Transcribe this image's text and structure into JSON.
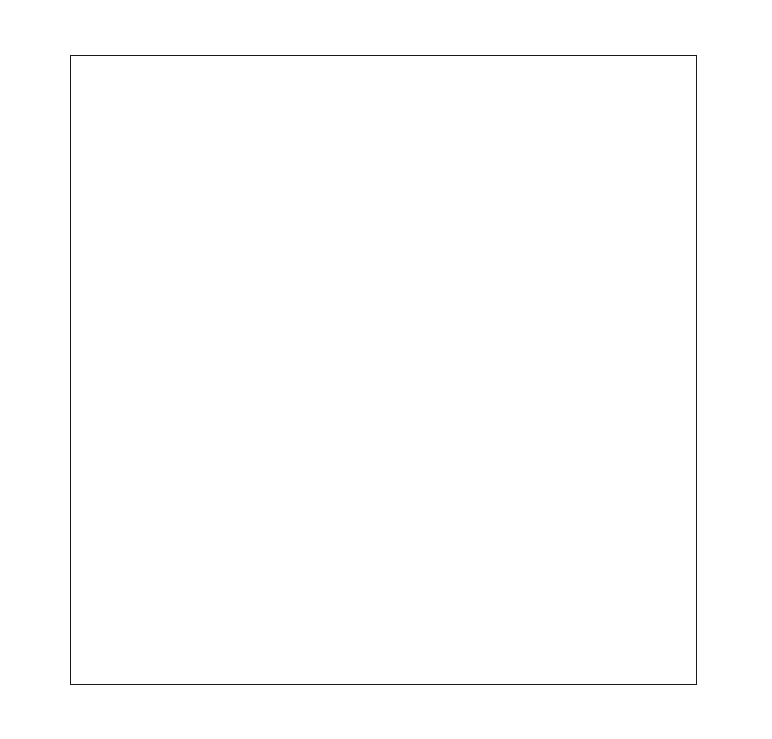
{
  "page": {
    "background_color": "#ffffff",
    "width": 772,
    "height": 739
  },
  "plot": {
    "frame_color": "#1a1a1a",
    "major_grid_color": "#2b2b2b",
    "minor_grid_color": "#b9b9b9",
    "left": 70,
    "top": 55,
    "width": 627,
    "height": 630
  },
  "chart_data": {
    "type": "grid",
    "title": "",
    "subtitle": "",
    "xlabel": "",
    "ylabel": "",
    "grid": "on",
    "legend": "none",
    "series": [],
    "values": [],
    "categories": [],
    "x_transform": "probit",
    "y_transform": "probit",
    "x_range_percent": [
      0.01,
      99.99
    ],
    "y_range_percent": [
      0.01,
      99.99
    ],
    "top_axis": {
      "position": "top",
      "direction": "descending-left-to-right",
      "labels": [
        "99.99",
        "99.96",
        "99.9",
        "99.8",
        "99",
        "98",
        "95",
        "90",
        "80",
        "70",
        "60",
        "50",
        "40",
        "30",
        "20",
        "10",
        "5",
        "2",
        "1",
        "0.2",
        "0.1",
        "0.04",
        "0.01"
      ],
      "values": [
        99.99,
        99.96,
        99.9,
        99.8,
        99,
        98,
        95,
        90,
        80,
        70,
        60,
        50,
        40,
        30,
        20,
        10,
        5,
        2,
        1,
        0.2,
        0.1,
        0.04,
        0.01
      ]
    },
    "bottom_axis": {
      "position": "bottom",
      "direction": "ascending-left-to-right",
      "labels": [
        "0.01",
        "0.04",
        "0.1",
        "0.2",
        "1",
        "2",
        "5",
        "10",
        "20",
        "30",
        "40",
        "50",
        "60",
        "70",
        "80",
        "90",
        "95",
        "98",
        "99",
        "99.8",
        "99.9",
        "99.96",
        "99.99"
      ],
      "values": [
        0.01,
        0.04,
        0.1,
        0.2,
        1,
        2,
        5,
        10,
        20,
        30,
        40,
        50,
        60,
        70,
        80,
        90,
        95,
        98,
        99,
        99.8,
        99.9,
        99.96,
        99.99
      ]
    },
    "left_axis": {
      "position": "left",
      "direction": "descending-top-to-bottom",
      "labels": [
        "99.99",
        "99.96",
        "99.9",
        "99.8",
        "99",
        "98",
        "95",
        "90",
        "80",
        "70",
        "60",
        "50",
        "40",
        "30",
        "20",
        "10",
        "5",
        "2",
        "1",
        "0.2",
        "0.1",
        "0.04",
        "0.01"
      ],
      "values": [
        99.99,
        99.96,
        99.9,
        99.8,
        99,
        98,
        95,
        90,
        80,
        70,
        60,
        50,
        40,
        30,
        20,
        10,
        5,
        2,
        1,
        0.2,
        0.1,
        0.04,
        0.01
      ]
    },
    "right_axis": {
      "position": "right",
      "direction": "ascending-top-to-bottom",
      "labels": [
        "0.01",
        "0.04",
        "0.1",
        "0.2",
        "1",
        "2",
        "5",
        "10",
        "20",
        "30",
        "40",
        "50",
        "60",
        "70",
        "80",
        "90",
        "95",
        "98",
        "99",
        "99.8",
        "99.9",
        "99.96",
        "99.99"
      ],
      "values": [
        0.01,
        0.04,
        0.1,
        0.2,
        1,
        2,
        5,
        10,
        20,
        30,
        40,
        50,
        60,
        70,
        80,
        90,
        95,
        98,
        99,
        99.8,
        99.9,
        99.96,
        99.99
      ]
    },
    "minor_gridline_percent_values": [
      0.01,
      0.02,
      0.03,
      0.04,
      0.05,
      0.06,
      0.07,
      0.08,
      0.09,
      0.1,
      0.15,
      0.2,
      0.3,
      0.4,
      0.5,
      0.6,
      0.7,
      0.8,
      0.9,
      1,
      1.5,
      2,
      3,
      4,
      5,
      6,
      7,
      8,
      9,
      10,
      15,
      20,
      25,
      30,
      35,
      40,
      45,
      50,
      55,
      60,
      65,
      70,
      75,
      80,
      85,
      90,
      91,
      92,
      93,
      94,
      95,
      96,
      97,
      98,
      99,
      99.1,
      99.2,
      99.3,
      99.4,
      99.5,
      99.6,
      99.7,
      99.8,
      99.85,
      99.9,
      99.91,
      99.92,
      99.93,
      99.94,
      99.95,
      99.96,
      99.97,
      99.98,
      99.99
    ],
    "major_gridline_percent_values": [
      0.01,
      0.04,
      0.1,
      0.2,
      1,
      2,
      5,
      10,
      20,
      30,
      40,
      50,
      60,
      70,
      80,
      90,
      95,
      98,
      99,
      99.8,
      99.9,
      99.96,
      99.99
    ]
  }
}
